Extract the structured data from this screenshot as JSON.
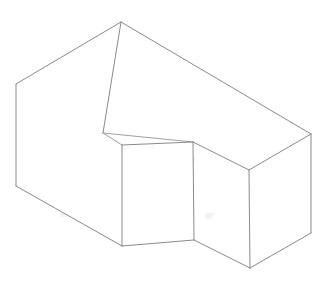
{
  "canvas": {
    "width": 327,
    "height": 284,
    "background_color": "#ffffff",
    "title": "Isometric line drawing of a rectangular block with a rectangular notch cut from the top front"
  },
  "style": {
    "stroke_color": "#8a8a8f",
    "stroke_color_soft": "#a0a0a6",
    "stroke_width": 1,
    "face_fill": "#ffffff",
    "smudge_color": "#f4f2f1"
  },
  "chart_data": {
    "type": "line",
    "xlabel": "",
    "ylabel": "",
    "xlim": [
      0,
      327
    ],
    "ylim": [
      0,
      284
    ],
    "grid": false,
    "legend": "none",
    "vertices": {
      "apex_top_back": [
        121,
        22
      ],
      "left_top_back": [
        16,
        84
      ],
      "left_bottom_back": [
        16,
        186
      ],
      "right_top": [
        311,
        134
      ],
      "right_bottom": [
        311,
        233
      ],
      "bottom_front_left": [
        122,
        246
      ],
      "bottom_notch_corner": [
        194,
        240
      ],
      "bottom_front_right": [
        250,
        268
      ],
      "notch_back_left": [
        103,
        133
      ],
      "notch_front_left_top": [
        122,
        145
      ],
      "notch_top_right": [
        193,
        142
      ],
      "notch_inner_corner": [
        249,
        170
      ]
    },
    "edges": [
      {
        "name": "top-back-left",
        "from": "left_top_back",
        "to": "apex_top_back"
      },
      {
        "name": "top-back-right",
        "from": "apex_top_back",
        "to": "right_top"
      },
      {
        "name": "left-vertical-back",
        "from": "left_top_back",
        "to": "left_bottom_back"
      },
      {
        "name": "right-vertical",
        "from": "right_top",
        "to": "right_bottom"
      },
      {
        "name": "bottom-left-front",
        "from": "left_bottom_back",
        "to": "bottom_front_left"
      },
      {
        "name": "bottom-front-mid",
        "from": "bottom_front_left",
        "to": "bottom_notch_corner"
      },
      {
        "name": "bottom-front-right",
        "from": "bottom_notch_corner",
        "to": "bottom_front_right"
      },
      {
        "name": "bottom-right-rise",
        "from": "bottom_front_right",
        "to": "right_bottom"
      },
      {
        "name": "apex-vertical-inner",
        "from": "apex_top_back",
        "to": "notch_back_left"
      },
      {
        "name": "notch-floor-left",
        "from": "notch_back_left",
        "to": "notch_front_left_top"
      },
      {
        "name": "notch-floor-back",
        "from": "notch_back_left",
        "to": "notch_top_right"
      },
      {
        "name": "notch-floor-front",
        "from": "notch_front_left_top",
        "to": "notch_top_right"
      },
      {
        "name": "notch-face-top-right",
        "from": "notch_top_right",
        "to": "notch_inner_corner"
      },
      {
        "name": "notch-front-vertical-left",
        "from": "notch_front_left_top",
        "to": "bottom_front_left"
      },
      {
        "name": "notch-front-vertical-right",
        "from": "notch_top_right",
        "to": "bottom_notch_corner"
      },
      {
        "name": "notch-inner-vertical",
        "from": "notch_inner_corner",
        "to": "bottom_front_right"
      },
      {
        "name": "right-top-to-inner",
        "from": "notch_inner_corner",
        "to": "right_top"
      }
    ],
    "faces": [
      {
        "name": "left-side-face",
        "points": "16,84 122,145 122,246 16,186"
      },
      {
        "name": "top-right-face",
        "points": "121,22 311,134 249,170 193,142 103,133"
      },
      {
        "name": "notch-front-face",
        "points": "122,145 193,142 194,240 122,246"
      },
      {
        "name": "right-front-face",
        "points": "249,170 311,134 311,233 250,268 194,240"
      }
    ]
  }
}
